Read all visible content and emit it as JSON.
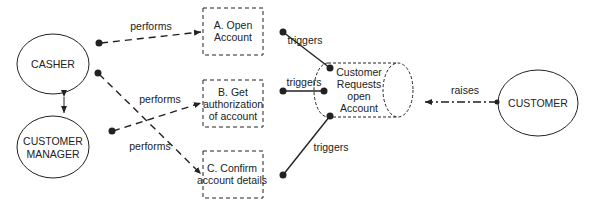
{
  "actors": {
    "casher": "CASHER",
    "customer_manager_l1": "CUSTOMER",
    "customer_manager_l2": "MANAGER",
    "customer": "CUSTOMER"
  },
  "tasks": {
    "a_l1": "A. Open",
    "a_l2": "Account",
    "b_l1": "B. Get",
    "b_l2": "authorization",
    "b_l3": "of account",
    "c_l1": "C. Confirm",
    "c_l2": "account details"
  },
  "event": {
    "l1": "Customer",
    "l2": "Requests",
    "l3": "open",
    "l4": "Account"
  },
  "labels": {
    "performs_a": "performs",
    "performs_b": "performs",
    "performs_c": "performs",
    "triggers_a": "triggers",
    "triggers_b": "triggers",
    "triggers_c": "triggers",
    "raises": "raises"
  },
  "colors": {
    "stroke": "#222222",
    "background": "#ffffff"
  }
}
